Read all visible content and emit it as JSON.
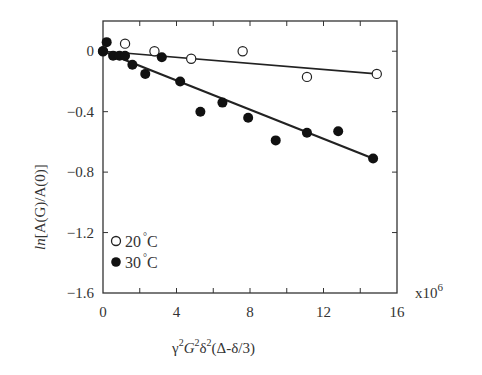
{
  "chart_data": {
    "type": "scatter",
    "title": "",
    "xlabel": "γ²G²δ²(Δ-δ/3)",
    "ylabel": "ln[A(G)/A(0)]",
    "x_multiplier": "x10^6",
    "xlim": [
      0,
      16
    ],
    "ylim": [
      -1.6,
      0.2
    ],
    "x_ticks": [
      0,
      4,
      8,
      12,
      16
    ],
    "x_minor_ticks": [
      2,
      6,
      10,
      14
    ],
    "y_ticks": [
      0,
      -0.4,
      -0.8,
      -1.2,
      -1.6
    ],
    "grid": false,
    "legend_position": "lower left",
    "series": [
      {
        "name": "20°C",
        "marker": "open-circle",
        "points": [
          [
            0,
            0
          ],
          [
            1.2,
            0.05
          ],
          [
            2.8,
            0.0
          ],
          [
            4.8,
            -0.05
          ],
          [
            7.6,
            0.0
          ],
          [
            11.1,
            -0.17
          ],
          [
            14.9,
            -0.15
          ]
        ],
        "fit_line": [
          [
            0,
            0
          ],
          [
            14.9,
            -0.15
          ]
        ]
      },
      {
        "name": "30°C",
        "marker": "filled-circle",
        "points": [
          [
            0,
            0
          ],
          [
            0.2,
            0.06
          ],
          [
            0.55,
            -0.03
          ],
          [
            0.9,
            -0.03
          ],
          [
            1.2,
            -0.03
          ],
          [
            1.6,
            -0.09
          ],
          [
            2.3,
            -0.15
          ],
          [
            3.2,
            -0.04
          ],
          [
            4.2,
            -0.2
          ],
          [
            5.3,
            -0.4
          ],
          [
            6.5,
            -0.34
          ],
          [
            7.9,
            -0.44
          ],
          [
            9.4,
            -0.59
          ],
          [
            11.1,
            -0.54
          ],
          [
            12.8,
            -0.53
          ],
          [
            14.7,
            -0.71
          ]
        ],
        "fit_line": [
          [
            0,
            0
          ],
          [
            14.7,
            -0.71
          ]
        ]
      }
    ]
  },
  "labels": {
    "xlabel_parts": [
      "γ",
      "2",
      "G",
      "2",
      "δ",
      "2",
      "(Δ-δ/3)"
    ],
    "ylabel_prefix": "ln",
    "ylabel_rest": "[A(G)/A(0)]",
    "multiplier_base": "x10",
    "multiplier_exp": "6",
    "legend": [
      {
        "num": "20",
        "unit": "C"
      },
      {
        "num": "30",
        "unit": "C"
      }
    ]
  },
  "colors": {
    "ink": "#222222",
    "axis": "#333333",
    "background": "#ffffff"
  }
}
